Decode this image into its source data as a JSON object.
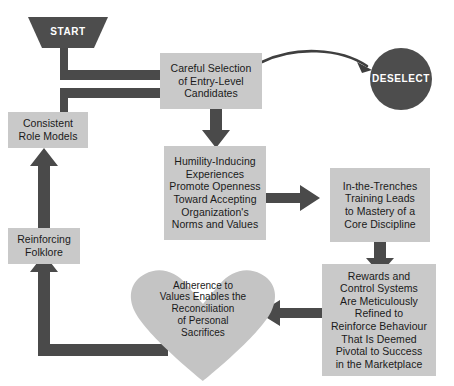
{
  "diagram": {
    "colors": {
      "box_fill": "#c9c9c9",
      "box_fill_alt": "#c4c4c4",
      "dark_shape": "#4d4d4d",
      "arrow": "#4a4a4a",
      "thin_arrow": "#3f3f3f",
      "text_dark": "#1a1a1a",
      "text_light": "#ffffff",
      "background": "#ffffff"
    },
    "nodes": {
      "start": {
        "label": "START",
        "shape": "inverted-trapezoid",
        "fill": "#4d4d4d",
        "text_color": "#ffffff"
      },
      "deselect": {
        "label": "DESELECT",
        "shape": "circle",
        "fill": "#4d4d4d",
        "text_color": "#ffffff"
      },
      "careful_selection": {
        "label": "Careful Selection\nof Entry-Level\nCandidates",
        "shape": "rect",
        "fill": "#c9c9c9"
      },
      "humility": {
        "label": "Humility-Inducing\nExperiences\nPromote Openness\nToward Accepting\nOrganization's\nNorms and Values",
        "shape": "rect",
        "fill": "#c9c9c9"
      },
      "trenches": {
        "label": "In-the-Trenches\nTraining Leads\nto Mastery of a\nCore Discipline",
        "shape": "rect",
        "fill": "#c9c9c9"
      },
      "rewards": {
        "label": "Rewards and\nControl Systems\nAre Meticulously\nRefined to\nReinforce Behaviour\nThat Is Deemed\nPivotal to Success\nin the Marketplace",
        "shape": "rect",
        "fill": "#c9c9c9"
      },
      "adherence": {
        "label": "Adherence to\nValues Enables the\nReconciliation\nof Personal\nSacrifices",
        "shape": "heart",
        "fill": "#c4c4c4"
      },
      "folklore": {
        "label": "Reinforcing\nFolklore",
        "shape": "rect",
        "fill": "#c9c9c9"
      },
      "role_models": {
        "label": "Consistent\nRole Models",
        "shape": "rect",
        "fill": "#c9c9c9"
      }
    },
    "edges": [
      {
        "name": "start-to-selection",
        "from": "start",
        "to": "careful_selection",
        "style": "thick-arrow"
      },
      {
        "name": "rolemodels-to-selection",
        "from": "role_models",
        "to": "careful_selection",
        "style": "thick-arrow"
      },
      {
        "name": "selection-to-deselect",
        "from": "careful_selection",
        "to": "deselect",
        "style": "thin-curved-arrow"
      },
      {
        "name": "selection-to-humility",
        "from": "careful_selection",
        "to": "humility",
        "style": "thick-arrow"
      },
      {
        "name": "humility-to-trenches",
        "from": "humility",
        "to": "trenches",
        "style": "thick-arrow"
      },
      {
        "name": "trenches-to-rewards",
        "from": "trenches",
        "to": "rewards",
        "style": "thick-arrow"
      },
      {
        "name": "rewards-to-adherence",
        "from": "rewards",
        "to": "adherence",
        "style": "thick-arrow"
      },
      {
        "name": "adherence-to-folklore",
        "from": "adherence",
        "to": "folklore",
        "style": "thick-arrow"
      },
      {
        "name": "folklore-to-rolemodels",
        "from": "folklore",
        "to": "role_models",
        "style": "thick-arrow"
      }
    ]
  }
}
